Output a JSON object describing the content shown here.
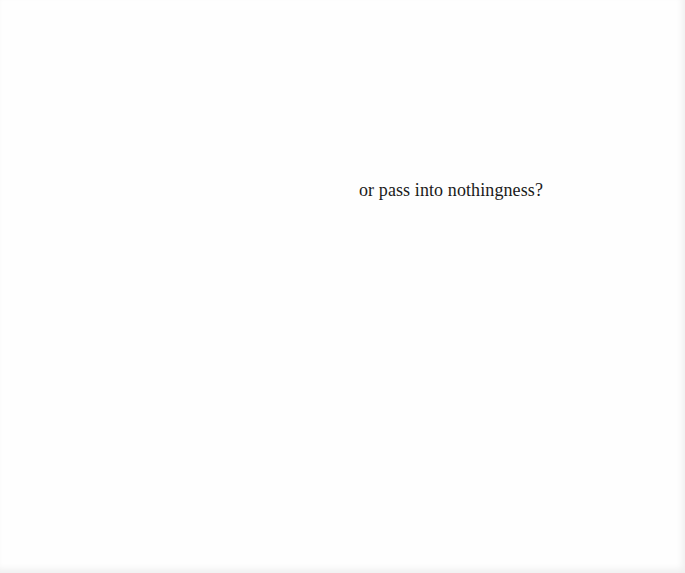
{
  "page": {
    "background": "#fefefe",
    "text_color": "#1a1a1a",
    "lines": [
      {
        "text": "or pass into nothingness?"
      }
    ]
  }
}
